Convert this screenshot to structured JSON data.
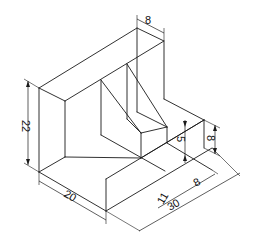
{
  "drawing": {
    "type": "isometric technical drawing",
    "line_color": "#1a1a1a",
    "background": "#ffffff",
    "dimensions": {
      "top_thickness": "8",
      "height": "22",
      "width": "20",
      "step_height_small": "5",
      "step_height_right": "8",
      "step_depth": "8",
      "inner_length": "11",
      "total_length": "30"
    }
  }
}
